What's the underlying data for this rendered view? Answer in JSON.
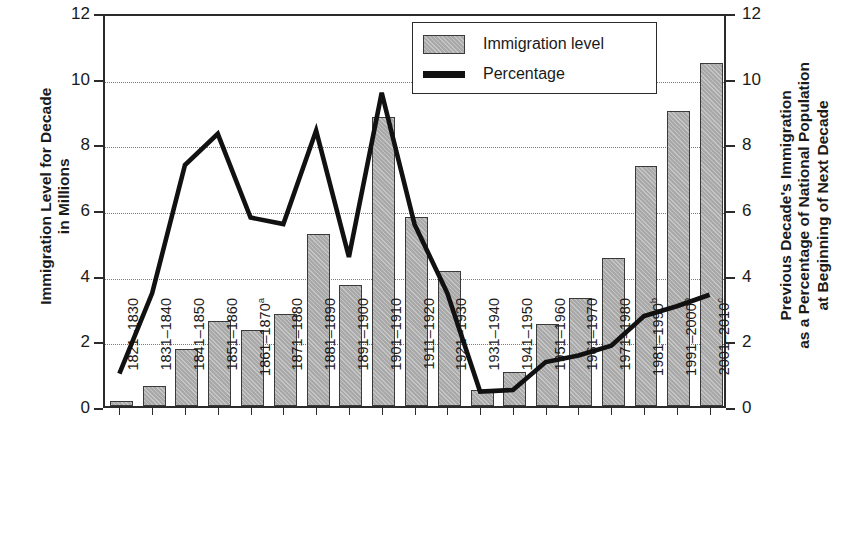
{
  "chart_data": {
    "type": "bar",
    "title": "",
    "subtitle": "",
    "xlabel": "",
    "ylabel": "Immigration Level for Decade\nin Millions",
    "y2label": "Previous Decade's Immigration\nas a Percentage of National Population\nat Beginning of Next Decade",
    "ylim": [
      0,
      12
    ],
    "y2lim": [
      0,
      12
    ],
    "yticks": [
      "0",
      "2",
      "4",
      "6",
      "8",
      "10",
      "12"
    ],
    "ytick_values": [
      0,
      2,
      4,
      6,
      8,
      10,
      12
    ],
    "y2ticks": [
      "0",
      "2",
      "4",
      "6",
      "8",
      "10",
      "12"
    ],
    "grid": true,
    "grid_axis": "y",
    "legend_position": "top-center",
    "legend": [
      {
        "label": "Immigration level",
        "type": "bar",
        "color": "#a9a9a9"
      },
      {
        "label": "Percentage",
        "type": "line",
        "color": "#111111"
      }
    ],
    "categories": [
      "1821–1830",
      "1831–1840",
      "1841–1850",
      "1851–1860",
      "1861–1870",
      "1871–1880",
      "1881–1890",
      "1891–1900",
      "1901–1910",
      "1911–1920",
      "1921–1930",
      "1931–1940",
      "1941–1950",
      "1951–1960",
      "1961–1970",
      "1971–1980",
      "1981–1990",
      "1991–2000",
      "2001–2010"
    ],
    "category_footnotes": [
      "",
      "",
      "",
      "",
      "a",
      "",
      "",
      "",
      "",
      "",
      "",
      "",
      "",
      "",
      "",
      "",
      "b",
      "b",
      "c"
    ],
    "series": [
      {
        "name": "Immigration level",
        "type": "bar",
        "unit": "millions",
        "color": "#a9a9a9",
        "values": [
          0.15,
          0.6,
          1.75,
          2.6,
          2.3,
          2.8,
          5.25,
          3.7,
          8.8,
          5.75,
          4.1,
          0.5,
          1.05,
          2.5,
          3.3,
          4.5,
          7.3,
          9.0,
          10.45
        ]
      },
      {
        "name": "Percentage",
        "type": "line",
        "unit": "percent",
        "color": "#111111",
        "values": [
          1.05,
          3.5,
          7.4,
          8.35,
          5.8,
          5.6,
          8.45,
          4.6,
          9.6,
          5.6,
          3.5,
          0.5,
          0.55,
          1.4,
          1.6,
          1.9,
          2.8,
          3.1,
          3.45
        ]
      }
    ]
  },
  "legend": {
    "bar_label": "Immigration level",
    "line_label": "Percentage"
  },
  "axes": {
    "left_title": "Immigration Level for Decade\nin Millions",
    "right_title": "Previous Decade's Immigration\nas a Percentage of National Population\nat Beginning of Next Decade"
  }
}
